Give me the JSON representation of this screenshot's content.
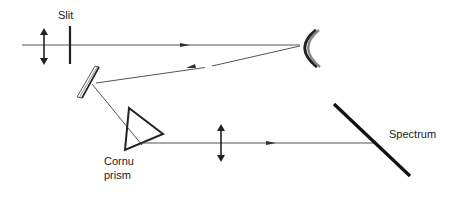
{
  "diagram": {
    "labels": {
      "slit": "Slit",
      "prism_line1": "Cornu",
      "prism_line2": "prism",
      "spectrum": "Spectrum"
    },
    "components": [
      "collimator-lens",
      "slit",
      "concave-mirror",
      "plane-mirror",
      "cornu-prism",
      "focusing-lens",
      "spectrum-plane"
    ],
    "colors": {
      "line": "#222222",
      "ray": "#555555"
    }
  }
}
